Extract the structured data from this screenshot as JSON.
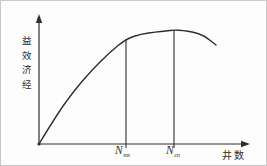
{
  "figure": {
    "background": "#fdfdfd",
    "border_color": "#c9c9c9",
    "stroke_color": "#2e2e2e"
  },
  "chart_data": {
    "type": "line",
    "title": "",
    "xlabel": "井数",
    "ylabel": "经济效益",
    "xlim": [
      0,
      10
    ],
    "ylim": [
      0,
      10
    ],
    "x_ticks": [],
    "y_ticks": [],
    "grid": false,
    "legend": null,
    "axes_style": "schematic sketch, arrow-ended axes, no tick marks or numeric scale",
    "series": [
      {
        "name": "economic-benefit-curve",
        "x": [
          0,
          0.81,
          1.62,
          2.48,
          3.33,
          4.14,
          4.86,
          5.57,
          6.05,
          6.43,
          6.86,
          7.33,
          7.86,
          8.43
        ],
        "y": [
          0,
          2.25,
          4.17,
          5.86,
          7.3,
          8.43,
          8.83,
          8.99,
          9.07,
          9.15,
          9.11,
          8.99,
          8.71,
          7.95
        ]
      }
    ],
    "annotations": [
      {
        "kind": "vline",
        "x": 4.14,
        "label": "N",
        "subscript": "ms"
      },
      {
        "kind": "vline",
        "x": 6.43,
        "label": "N",
        "subscript": "co"
      }
    ],
    "pixel_geometry": {
      "axis_origin": [
        38,
        143
      ],
      "x_axis_end": [
        242,
        143
      ],
      "y_axis_end": [
        38,
        20
      ],
      "x_arrow_tip": [
        249,
        143
      ],
      "y_arrow_tip": [
        38,
        13
      ],
      "curve_px": [
        [
          38,
          143
        ],
        [
          55,
          115
        ],
        [
          72,
          91
        ],
        [
          90,
          70
        ],
        [
          108,
          52
        ],
        [
          125,
          38
        ],
        [
          140,
          33
        ],
        [
          155,
          31
        ],
        [
          165,
          30
        ],
        [
          173,
          29
        ],
        [
          182,
          29.5
        ],
        [
          192,
          31
        ],
        [
          203,
          34.5
        ],
        [
          215,
          44
        ]
      ],
      "vlines_px": [
        {
          "x": 125,
          "y_top": 38,
          "y_bottom": 147
        },
        {
          "x": 173,
          "y_top": 29,
          "y_bottom": 147
        }
      ]
    }
  }
}
